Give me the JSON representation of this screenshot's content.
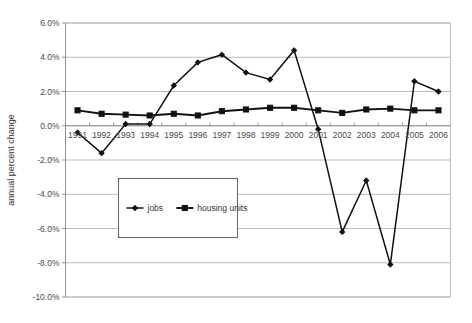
{
  "chart_data": {
    "type": "line",
    "title": "",
    "xlabel": "",
    "ylabel": "annual percent change",
    "ylim": [
      -10.0,
      6.0
    ],
    "ytick_step": 2.0,
    "ytick_labels": [
      "6.0%",
      "4.0%",
      "2.0%",
      "0.0%",
      "-2.0%",
      "-4.0%",
      "-6.0%",
      "-8.0%",
      "-10.0%"
    ],
    "ytick_values": [
      6.0,
      4.0,
      2.0,
      0.0,
      -2.0,
      -4.0,
      -6.0,
      -8.0,
      -10.0
    ],
    "grid": true,
    "legend_position": "center-left-inside",
    "categories": [
      "1991",
      "1992",
      "1993",
      "1994",
      "1995",
      "1996",
      "1997",
      "1998",
      "1999",
      "2000",
      "2001",
      "2002",
      "2003",
      "2004",
      "2005",
      "2006"
    ],
    "x": [
      1991,
      1992,
      1993,
      1994,
      1995,
      1996,
      1997,
      1998,
      1999,
      2000,
      2001,
      2002,
      2003,
      2004,
      2005,
      2006
    ],
    "series": [
      {
        "name": "jobs",
        "marker": "diamond",
        "color": "#111111",
        "values": [
          -0.4,
          -1.6,
          0.1,
          0.1,
          2.35,
          3.7,
          4.15,
          3.1,
          2.7,
          4.4,
          -0.2,
          -6.2,
          -3.2,
          -8.1,
          2.6,
          2.0
        ]
      },
      {
        "name": "housing units",
        "marker": "square",
        "color": "#111111",
        "values": [
          0.9,
          0.7,
          0.65,
          0.6,
          0.7,
          0.6,
          0.85,
          0.95,
          1.05,
          1.05,
          0.9,
          0.75,
          0.95,
          1.0,
          0.9,
          0.9
        ]
      }
    ],
    "legend": [
      {
        "label": "jobs",
        "marker": "diamond"
      },
      {
        "label": "housing units",
        "marker": "square"
      }
    ]
  },
  "colors": {
    "background": "#ffffff",
    "grid": "#a9a9a9",
    "axis": "#8a8a8a",
    "series": "#111111",
    "text": "#333333",
    "tick_text": "#4a4a4a"
  }
}
